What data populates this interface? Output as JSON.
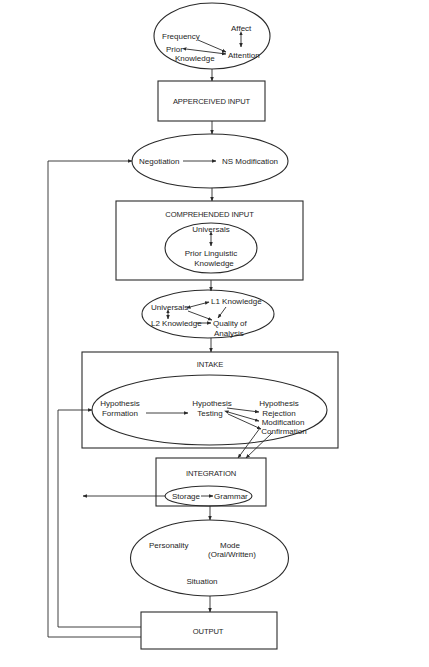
{
  "diagram": {
    "input_factors": {
      "frequency": "Frequency",
      "affect": "Affect",
      "prior": "Prior",
      "knowledge": "Knowledge",
      "attention": "Attention"
    },
    "apperceived_input": "APPERCEIVED INPUT",
    "negotiation": {
      "negotiation": "Negotiation",
      "ns_modification": "NS Modification"
    },
    "comprehended_input": {
      "title": "COMPREHENDED INPUT",
      "universals": "Universals",
      "prior_linguistic": "Prior Linguistic",
      "knowledge": "Knowledge"
    },
    "analysis": {
      "universals": "Universals",
      "l1_knowledge": "L1 Knowledge",
      "l2_knowledge": "L2 Knowledge",
      "quality_of": "Quality of",
      "analysis": "Analysis"
    },
    "intake": {
      "title": "INTAKE",
      "hypothesis_formation_1": "Hypothesis",
      "hypothesis_formation_2": "Formation",
      "hypothesis_testing_1": "Hypothesis",
      "hypothesis_testing_2": "Testing",
      "hypothesis_outcome": "Hypothesis",
      "rejection": "Rejection",
      "modification": "Modification",
      "confirmation": "Confirmation"
    },
    "integration": {
      "title": "INTEGRATION",
      "storage": "Storage",
      "grammar": "Grammar"
    },
    "output_factors": {
      "personality": "Personality",
      "mode": "Mode",
      "mode_detail": "(Oral/Written)",
      "situation": "Situation"
    },
    "output": "OUTPUT"
  }
}
